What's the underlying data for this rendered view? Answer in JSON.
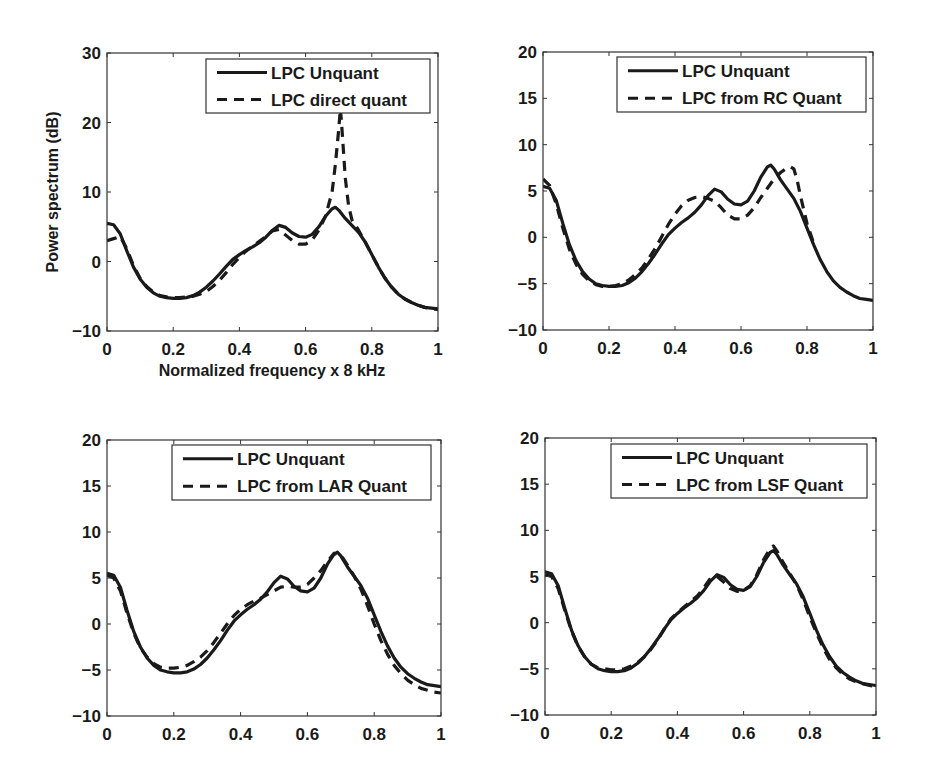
{
  "figure": {
    "background": "#ffffff",
    "line_color": "#1a1a1a",
    "axis_color": "#333333"
  },
  "chart_data": [
    {
      "type": "line",
      "panel": "top-left",
      "title": "",
      "xlabel": "Normalized frequency x 8 kHz",
      "ylabel": "Power spectrum (dB)",
      "xlim": [
        0,
        1
      ],
      "ylim": [
        -10,
        30
      ],
      "xticks": [
        0,
        0.2,
        0.4,
        0.6,
        0.8,
        1
      ],
      "xtick_labels": [
        "0",
        "0.2",
        "0.4",
        "0.6",
        "0.8",
        "1"
      ],
      "yticks": [
        -10,
        0,
        10,
        20,
        30
      ],
      "ytick_labels": [
        "−10",
        "0",
        "10",
        "20",
        "30"
      ],
      "grid": false,
      "legend_position": "upper right",
      "box": {
        "left": 107,
        "top": 53,
        "right": 438,
        "bottom": 331
      },
      "legend_box": {
        "left": 206,
        "top": 59,
        "right": 430,
        "bottom": 113
      },
      "series": [
        {
          "name": "LPC Unquant",
          "style": "solid",
          "x": [
            0,
            0.02,
            0.04,
            0.06,
            0.08,
            0.1,
            0.12,
            0.14,
            0.16,
            0.18,
            0.2,
            0.22,
            0.24,
            0.26,
            0.28,
            0.3,
            0.32,
            0.34,
            0.36,
            0.38,
            0.4,
            0.42,
            0.44,
            0.46,
            0.48,
            0.5,
            0.52,
            0.54,
            0.56,
            0.58,
            0.6,
            0.62,
            0.64,
            0.66,
            0.68,
            0.69,
            0.7,
            0.72,
            0.74,
            0.76,
            0.78,
            0.8,
            0.82,
            0.84,
            0.86,
            0.88,
            0.9,
            0.92,
            0.94,
            0.96,
            0.98,
            1.0
          ],
          "y": [
            5.5,
            5.3,
            4.0,
            1.5,
            -0.8,
            -2.5,
            -3.7,
            -4.5,
            -5.0,
            -5.2,
            -5.3,
            -5.3,
            -5.2,
            -4.9,
            -4.4,
            -3.7,
            -2.8,
            -1.8,
            -0.7,
            0.3,
            1.0,
            1.6,
            2.1,
            2.7,
            3.5,
            4.5,
            5.2,
            4.9,
            4.1,
            3.6,
            3.5,
            3.9,
            5.0,
            6.5,
            7.6,
            7.8,
            7.4,
            6.2,
            5.2,
            4.2,
            2.8,
            1.0,
            -0.8,
            -2.4,
            -3.7,
            -4.7,
            -5.4,
            -5.9,
            -6.3,
            -6.6,
            -6.7,
            -6.8
          ]
        },
        {
          "name": "LPC direct quant",
          "style": "dashed",
          "x": [
            0,
            0.02,
            0.04,
            0.06,
            0.08,
            0.1,
            0.12,
            0.14,
            0.16,
            0.18,
            0.2,
            0.22,
            0.24,
            0.26,
            0.28,
            0.3,
            0.32,
            0.34,
            0.36,
            0.38,
            0.4,
            0.42,
            0.44,
            0.46,
            0.48,
            0.5,
            0.52,
            0.54,
            0.56,
            0.58,
            0.6,
            0.62,
            0.64,
            0.66,
            0.68,
            0.69,
            0.7,
            0.705,
            0.71,
            0.72,
            0.73,
            0.74,
            0.76,
            0.78,
            0.8,
            0.82,
            0.84,
            0.86,
            0.88,
            0.9,
            0.92,
            0.94,
            0.96,
            0.98,
            1.0
          ],
          "y": [
            3.0,
            3.3,
            3.6,
            1.8,
            -0.6,
            -2.4,
            -3.6,
            -4.4,
            -4.9,
            -5.1,
            -5.2,
            -5.2,
            -5.1,
            -5.0,
            -4.7,
            -4.3,
            -3.6,
            -2.7,
            -1.6,
            -0.4,
            0.6,
            1.5,
            2.2,
            2.9,
            3.6,
            4.4,
            4.6,
            3.8,
            3.0,
            2.5,
            2.5,
            3.1,
            4.5,
            6.5,
            10.0,
            14.0,
            19.0,
            22.0,
            19.0,
            12.0,
            8.0,
            6.0,
            4.5,
            2.8,
            1.0,
            -0.8,
            -2.4,
            -3.7,
            -4.7,
            -5.4,
            -5.9,
            -6.3,
            -6.6,
            -6.8,
            -6.9
          ]
        }
      ]
    },
    {
      "type": "line",
      "panel": "top-right",
      "title": "",
      "xlabel": "",
      "ylabel": "",
      "xlim": [
        0,
        1
      ],
      "ylim": [
        -10,
        20
      ],
      "xticks": [
        0,
        0.2,
        0.4,
        0.6,
        0.8,
        1
      ],
      "xtick_labels": [
        "0",
        "0.2",
        "0.4",
        "0.6",
        "0.8",
        "1"
      ],
      "yticks": [
        -10,
        -5,
        0,
        5,
        10,
        15,
        20
      ],
      "ytick_labels": [
        "−10",
        "−5",
        "0",
        "5",
        "10",
        "15",
        "20"
      ],
      "grid": false,
      "legend_position": "upper right",
      "box": {
        "left": 543,
        "top": 52,
        "right": 873,
        "bottom": 330
      },
      "legend_box": {
        "left": 617,
        "top": 57,
        "right": 866,
        "bottom": 112
      },
      "series": [
        {
          "name": "LPC Unquant",
          "style": "solid",
          "x": [
            0,
            0.02,
            0.04,
            0.06,
            0.08,
            0.1,
            0.12,
            0.14,
            0.16,
            0.18,
            0.2,
            0.22,
            0.24,
            0.26,
            0.28,
            0.3,
            0.32,
            0.34,
            0.36,
            0.38,
            0.4,
            0.42,
            0.44,
            0.46,
            0.48,
            0.5,
            0.52,
            0.54,
            0.56,
            0.58,
            0.6,
            0.62,
            0.64,
            0.66,
            0.68,
            0.69,
            0.7,
            0.72,
            0.74,
            0.76,
            0.78,
            0.8,
            0.82,
            0.84,
            0.86,
            0.88,
            0.9,
            0.92,
            0.94,
            0.96,
            0.98,
            1.0
          ],
          "y": [
            5.5,
            5.3,
            4.0,
            1.5,
            -0.8,
            -2.5,
            -3.7,
            -4.5,
            -5.0,
            -5.2,
            -5.3,
            -5.3,
            -5.2,
            -4.9,
            -4.4,
            -3.7,
            -2.8,
            -1.8,
            -0.7,
            0.3,
            1.0,
            1.6,
            2.1,
            2.7,
            3.5,
            4.5,
            5.2,
            4.9,
            4.1,
            3.6,
            3.5,
            3.9,
            5.0,
            6.5,
            7.6,
            7.8,
            7.4,
            6.2,
            5.2,
            4.2,
            2.8,
            1.0,
            -0.8,
            -2.4,
            -3.7,
            -4.7,
            -5.4,
            -5.9,
            -6.3,
            -6.6,
            -6.7,
            -6.8
          ]
        },
        {
          "name": "LPC from RC Quant",
          "style": "dashed",
          "x": [
            0,
            0.02,
            0.04,
            0.06,
            0.08,
            0.1,
            0.12,
            0.14,
            0.16,
            0.18,
            0.2,
            0.22,
            0.24,
            0.26,
            0.28,
            0.3,
            0.32,
            0.34,
            0.36,
            0.38,
            0.4,
            0.42,
            0.44,
            0.46,
            0.48,
            0.5,
            0.52,
            0.54,
            0.56,
            0.58,
            0.6,
            0.62,
            0.64,
            0.66,
            0.68,
            0.7,
            0.72,
            0.74,
            0.75,
            0.76,
            0.77,
            0.78,
            0.8,
            0.82
          ],
          "y": [
            6.3,
            5.6,
            3.6,
            1.0,
            -1.3,
            -2.9,
            -4.0,
            -4.7,
            -5.1,
            -5.3,
            -5.3,
            -5.2,
            -5.0,
            -4.6,
            -4.0,
            -3.3,
            -2.3,
            -1.2,
            0.1,
            1.4,
            2.5,
            3.4,
            4.0,
            4.3,
            4.4,
            4.2,
            3.9,
            3.2,
            2.4,
            2.0,
            2.0,
            2.4,
            3.2,
            4.3,
            5.3,
            6.3,
            7.0,
            7.5,
            7.6,
            7.4,
            6.2,
            4.5,
            1.5,
            -0.6
          ]
        }
      ]
    },
    {
      "type": "line",
      "panel": "bottom-left",
      "title": "",
      "xlabel": "",
      "ylabel": "",
      "xlim": [
        0,
        1
      ],
      "ylim": [
        -10,
        20
      ],
      "xticks": [
        0,
        0.2,
        0.4,
        0.6,
        0.8,
        1
      ],
      "xtick_labels": [
        "0",
        "0.2",
        "0.4",
        "0.6",
        "0.8",
        "1"
      ],
      "yticks": [
        -10,
        -5,
        0,
        5,
        10,
        15,
        20
      ],
      "ytick_labels": [
        "−10",
        "−5",
        "0",
        "5",
        "10",
        "15",
        "20"
      ],
      "grid": false,
      "legend_position": "upper right",
      "box": {
        "left": 107,
        "top": 440,
        "right": 441,
        "bottom": 716
      },
      "legend_box": {
        "left": 172,
        "top": 445,
        "right": 431,
        "bottom": 500
      },
      "series": [
        {
          "name": "LPC Unquant",
          "style": "solid",
          "x": [
            0,
            0.02,
            0.04,
            0.06,
            0.08,
            0.1,
            0.12,
            0.14,
            0.16,
            0.18,
            0.2,
            0.22,
            0.24,
            0.26,
            0.28,
            0.3,
            0.32,
            0.34,
            0.36,
            0.38,
            0.4,
            0.42,
            0.44,
            0.46,
            0.48,
            0.5,
            0.52,
            0.54,
            0.56,
            0.58,
            0.6,
            0.62,
            0.64,
            0.66,
            0.68,
            0.69,
            0.7,
            0.72,
            0.74,
            0.76,
            0.78,
            0.8,
            0.82,
            0.84,
            0.86,
            0.88,
            0.9,
            0.92,
            0.94,
            0.96,
            0.98,
            1.0
          ],
          "y": [
            5.5,
            5.3,
            4.0,
            1.5,
            -0.8,
            -2.5,
            -3.7,
            -4.5,
            -5.0,
            -5.2,
            -5.3,
            -5.3,
            -5.2,
            -4.9,
            -4.4,
            -3.7,
            -2.8,
            -1.8,
            -0.7,
            0.3,
            1.0,
            1.6,
            2.1,
            2.7,
            3.5,
            4.5,
            5.2,
            4.9,
            4.1,
            3.6,
            3.5,
            3.9,
            5.0,
            6.5,
            7.6,
            7.8,
            7.4,
            6.2,
            5.2,
            4.2,
            2.8,
            1.0,
            -0.8,
            -2.4,
            -3.7,
            -4.7,
            -5.4,
            -5.9,
            -6.3,
            -6.6,
            -6.7,
            -6.8
          ]
        },
        {
          "name": "LPC from LAR Quant",
          "style": "dashed",
          "x": [
            0,
            0.02,
            0.04,
            0.06,
            0.08,
            0.1,
            0.12,
            0.14,
            0.16,
            0.18,
            0.2,
            0.22,
            0.24,
            0.26,
            0.28,
            0.3,
            0.32,
            0.34,
            0.36,
            0.38,
            0.4,
            0.42,
            0.44,
            0.46,
            0.48,
            0.5,
            0.52,
            0.54,
            0.56,
            0.58,
            0.6,
            0.62,
            0.64,
            0.66,
            0.68,
            0.7,
            0.72,
            0.74,
            0.76,
            0.78,
            0.8,
            0.82,
            0.84,
            0.86,
            0.88,
            0.9,
            0.92,
            0.94,
            0.96,
            0.98,
            1.0
          ],
          "y": [
            5.3,
            5.0,
            3.6,
            1.2,
            -1.0,
            -2.6,
            -3.6,
            -4.3,
            -4.7,
            -4.8,
            -4.8,
            -4.7,
            -4.5,
            -4.1,
            -3.6,
            -2.9,
            -2.0,
            -1.0,
            0.0,
            0.9,
            1.6,
            2.1,
            2.5,
            2.8,
            3.2,
            3.6,
            4.0,
            4.1,
            4.0,
            4.0,
            4.3,
            5.0,
            5.8,
            6.8,
            7.7,
            7.5,
            6.4,
            5.2,
            3.8,
            2.0,
            0.0,
            -1.8,
            -3.3,
            -4.5,
            -5.4,
            -6.1,
            -6.6,
            -7.0,
            -7.2,
            -7.4,
            -7.5
          ]
        }
      ]
    },
    {
      "type": "line",
      "panel": "bottom-right",
      "title": "",
      "xlabel": "",
      "ylabel": "",
      "xlim": [
        0,
        1
      ],
      "ylim": [
        -10,
        20
      ],
      "xticks": [
        0,
        0.2,
        0.4,
        0.6,
        0.8,
        1
      ],
      "xtick_labels": [
        "0",
        "0.2",
        "0.4",
        "0.6",
        "0.8",
        "1"
      ],
      "yticks": [
        -10,
        -5,
        0,
        5,
        10,
        15,
        20
      ],
      "ytick_labels": [
        "−10",
        "−5",
        "0",
        "5",
        "10",
        "15",
        "20"
      ],
      "grid": false,
      "legend_position": "upper right",
      "box": {
        "left": 545,
        "top": 438,
        "right": 876,
        "bottom": 715
      },
      "legend_box": {
        "left": 611,
        "top": 444,
        "right": 867,
        "bottom": 498
      },
      "series": [
        {
          "name": "LPC Unquant",
          "style": "solid",
          "x": [
            0,
            0.02,
            0.04,
            0.06,
            0.08,
            0.1,
            0.12,
            0.14,
            0.16,
            0.18,
            0.2,
            0.22,
            0.24,
            0.26,
            0.28,
            0.3,
            0.32,
            0.34,
            0.36,
            0.38,
            0.4,
            0.42,
            0.44,
            0.46,
            0.48,
            0.5,
            0.52,
            0.54,
            0.56,
            0.58,
            0.6,
            0.62,
            0.64,
            0.66,
            0.68,
            0.69,
            0.7,
            0.72,
            0.74,
            0.76,
            0.78,
            0.8,
            0.82,
            0.84,
            0.86,
            0.88,
            0.9,
            0.92,
            0.94,
            0.96,
            0.98,
            1.0
          ],
          "y": [
            5.5,
            5.3,
            4.0,
            1.5,
            -0.8,
            -2.5,
            -3.7,
            -4.5,
            -5.0,
            -5.2,
            -5.3,
            -5.3,
            -5.2,
            -4.9,
            -4.4,
            -3.7,
            -2.8,
            -1.8,
            -0.7,
            0.3,
            1.0,
            1.6,
            2.1,
            2.7,
            3.5,
            4.5,
            5.2,
            4.9,
            4.1,
            3.6,
            3.5,
            3.9,
            5.0,
            6.5,
            7.6,
            7.8,
            7.4,
            6.2,
            5.2,
            4.2,
            2.8,
            1.0,
            -0.8,
            -2.4,
            -3.7,
            -4.7,
            -5.4,
            -5.9,
            -6.3,
            -6.6,
            -6.7,
            -6.8
          ]
        },
        {
          "name": "LPC from LSF Quant",
          "style": "dashed",
          "x": [
            0,
            0.02,
            0.04,
            0.06,
            0.08,
            0.1,
            0.12,
            0.14,
            0.16,
            0.18,
            0.2,
            0.22,
            0.24,
            0.26,
            0.28,
            0.3,
            0.32,
            0.34,
            0.36,
            0.38,
            0.4,
            0.42,
            0.44,
            0.46,
            0.48,
            0.5,
            0.52,
            0.54,
            0.56,
            0.58,
            0.6,
            0.62,
            0.64,
            0.66,
            0.68,
            0.69,
            0.7,
            0.72,
            0.74,
            0.76,
            0.78,
            0.8,
            0.82,
            0.84,
            0.86,
            0.88,
            0.9,
            0.92,
            0.94,
            0.96,
            0.98,
            1.0
          ],
          "y": [
            5.2,
            5.0,
            3.7,
            1.3,
            -0.9,
            -2.6,
            -3.7,
            -4.5,
            -4.9,
            -5.0,
            -5.1,
            -5.1,
            -5.0,
            -4.7,
            -4.3,
            -3.7,
            -2.9,
            -1.9,
            -0.7,
            0.4,
            1.1,
            1.7,
            2.3,
            2.9,
            3.8,
            4.8,
            5.0,
            4.4,
            3.7,
            3.4,
            3.5,
            4.0,
            5.2,
            6.8,
            8.0,
            8.3,
            7.8,
            6.5,
            5.3,
            4.1,
            2.5,
            0.6,
            -1.1,
            -2.7,
            -4.0,
            -4.9,
            -5.6,
            -6.1,
            -6.4,
            -6.6,
            -6.8,
            -6.9
          ]
        }
      ]
    }
  ]
}
